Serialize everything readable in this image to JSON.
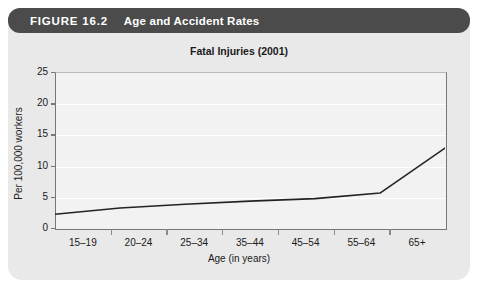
{
  "figure": {
    "label": "FIGURE 16.2",
    "caption": "Age and Accident Rates"
  },
  "colors": {
    "header_bar": "#4b4b4b",
    "panel": "#e9e9e9",
    "plot_background": "#f2f2f2",
    "gridline": "#ffffff",
    "axis": "#777777",
    "series_line": "#222222",
    "text": "#1a1a1a",
    "header_text": "#ffffff"
  },
  "chart_data": {
    "type": "line",
    "title": "Fatal Injuries (2001)",
    "xlabel": "Age (in years)",
    "ylabel": "Per 100,000 workers",
    "categories": [
      "15–19",
      "20–24",
      "25–34",
      "35–44",
      "45–54",
      "55–64",
      "65+"
    ],
    "values": [
      2.2,
      3.2,
      3.8,
      4.3,
      4.7,
      5.6,
      12.8
    ],
    "series": [
      {
        "name": "Fatal Injuries (2001)",
        "values": [
          2.2,
          3.2,
          3.8,
          4.3,
          4.7,
          5.6,
          12.8
        ]
      }
    ],
    "ylim": [
      0,
      25
    ],
    "yticks": [
      0,
      5,
      10,
      15,
      20,
      25
    ],
    "ytick_labels": [
      "0",
      "5",
      "10",
      "15",
      "20",
      "25"
    ],
    "grid": true,
    "grid_axis": "y",
    "legend": false,
    "legend_position": "none",
    "markers": false
  }
}
